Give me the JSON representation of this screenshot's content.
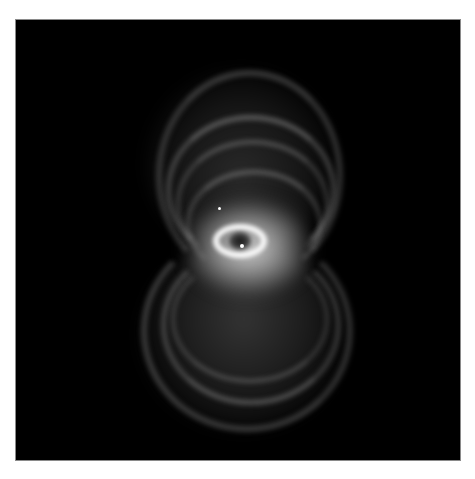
{
  "image": {
    "subject": "bipolar planetary nebula (hourglass shape), grayscale",
    "background_color": "#000000",
    "page_background": "#ffffff",
    "frame": {
      "x": 16,
      "y": 20,
      "width": 444,
      "height": 440
    },
    "features": {
      "upper_lobe": {
        "center_x": 240,
        "center_y": 140,
        "approx_width": 190,
        "approx_height": 150
      },
      "lower_lobe": {
        "center_x": 240,
        "center_y": 330,
        "approx_width": 200,
        "approx_height": 170
      },
      "central_ring": {
        "center_x": 238,
        "center_y": 240,
        "approx_width": 50,
        "approx_height": 30
      },
      "central_star": {
        "x": 242,
        "y": 247
      },
      "field_star": {
        "x": 219,
        "y": 208
      }
    }
  }
}
